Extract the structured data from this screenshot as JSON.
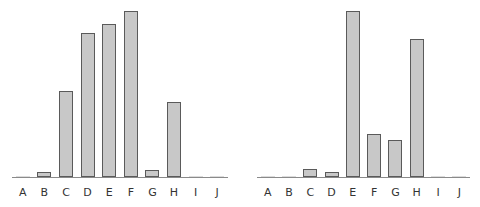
{
  "chart_data": [
    {
      "type": "bar",
      "title": "",
      "xlabel": "",
      "ylabel": "",
      "categories": [
        "A",
        "B",
        "C",
        "D",
        "E",
        "F",
        "G",
        "H",
        "I",
        "J"
      ],
      "values": [
        0,
        3,
        52,
        87,
        92,
        100,
        4,
        45,
        0,
        0
      ],
      "ylim": [
        0,
        100
      ],
      "grid": false,
      "bar_color": "#c8c8c8",
      "edge_color": "#5a5a5a"
    },
    {
      "type": "bar",
      "title": "",
      "xlabel": "",
      "ylabel": "",
      "categories": [
        "A",
        "B",
        "C",
        "D",
        "E",
        "F",
        "G",
        "H",
        "I",
        "J"
      ],
      "values": [
        0,
        0,
        5,
        3,
        100,
        26,
        22,
        83,
        0,
        0
      ],
      "ylim": [
        0,
        100
      ],
      "grid": false,
      "bar_color": "#c8c8c8",
      "edge_color": "#5a5a5a"
    }
  ]
}
